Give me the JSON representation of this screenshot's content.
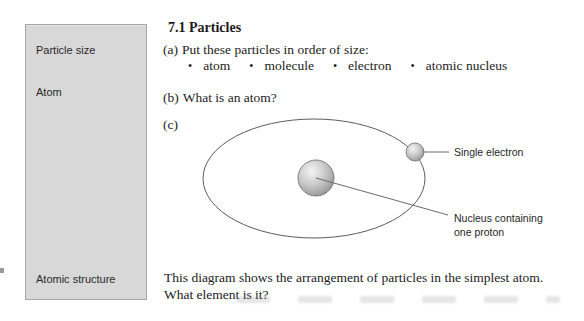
{
  "sidebar": {
    "items": [
      {
        "label": "Particle size"
      },
      {
        "label": "Atom"
      },
      {
        "label": "Atomic structure"
      }
    ]
  },
  "content": {
    "title": "7.1 Particles",
    "question_a": {
      "label": "(a)",
      "text": "Put these particles in order of size:"
    },
    "bullet_char": "•",
    "bullets": [
      "atom",
      "molecule",
      "electron",
      "atomic nucleus"
    ],
    "question_b": {
      "label": "(b)",
      "text": "What is an atom?"
    },
    "question_c_label": "(c)",
    "closing": {
      "line1": "This diagram shows the arrangement of particles in the simplest atom.",
      "line2": "What element is it?"
    }
  },
  "diagram": {
    "labels": {
      "electron": "Single electron",
      "nucleus_line1": "Nucleus containing",
      "nucleus_line2": "one proton"
    }
  },
  "colors": {
    "sidebar_bg": "#d8d8d8",
    "sidebar_border": "#a6a6a6",
    "text": "#1c1c1c",
    "orbit_stroke": "#5c5c5c",
    "leader_line": "#6b6b6b",
    "sphere_light": "#f4f4f4",
    "sphere_dark": "#8f8f8f"
  }
}
